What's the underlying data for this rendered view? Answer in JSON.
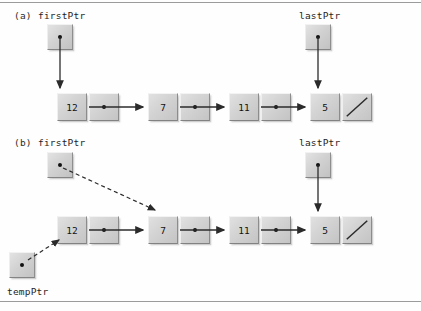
{
  "figure": {
    "colors": {
      "box_face": "#d4d4d4",
      "box_highlight": "#f2f2f2",
      "box_shadow": "#848484",
      "line": "#2b2b2b",
      "rule": "#9b9b9b",
      "text": "#1d1d1d"
    },
    "rules": {
      "top_label": "top-divider",
      "bottom_label": "bottom-divider"
    }
  },
  "parts": [
    {
      "id": "a",
      "part_label": "(a)",
      "pointers": [
        {
          "name": "firstPtr",
          "label": "firstPtr",
          "target": "node-12",
          "arrow_style": "solid"
        },
        {
          "name": "lastPtr",
          "label": "lastPtr",
          "target": "node-5",
          "arrow_style": "solid"
        }
      ],
      "nodes": [
        {
          "id": "node-12",
          "value": "12",
          "link": "dot"
        },
        {
          "id": "node-7",
          "value": "7",
          "link": "dot"
        },
        {
          "id": "node-11",
          "value": "11",
          "link": "dot"
        },
        {
          "id": "node-5",
          "value": "5",
          "link": "null"
        }
      ]
    },
    {
      "id": "b",
      "part_label": "(b)",
      "pointers": [
        {
          "name": "firstPtr",
          "label": "firstPtr",
          "target": "node-7",
          "arrow_style": "dashed"
        },
        {
          "name": "lastPtr",
          "label": "lastPtr",
          "target": "node-5",
          "arrow_style": "solid"
        },
        {
          "name": "tempPtr",
          "label": "tempPtr",
          "target": "node-12",
          "arrow_style": "dashed"
        }
      ],
      "nodes": [
        {
          "id": "node-12",
          "value": "12",
          "link": "dot"
        },
        {
          "id": "node-7",
          "value": "7",
          "link": "dot"
        },
        {
          "id": "node-11",
          "value": "11",
          "link": "dot"
        },
        {
          "id": "node-5",
          "value": "5",
          "link": "null"
        }
      ]
    }
  ],
  "text": {
    "a_part": "(a)",
    "a_firstPtr": "firstPtr",
    "a_lastPtr": "lastPtr",
    "b_part": "(b)",
    "b_firstPtr": "firstPtr",
    "b_lastPtr": "lastPtr",
    "b_tempPtr": "tempPtr",
    "a_n1": "12",
    "a_n2": "7",
    "a_n3": "11",
    "a_n4": "5",
    "b_n1": "12",
    "b_n2": "7",
    "b_n3": "11",
    "b_n4": "5"
  }
}
